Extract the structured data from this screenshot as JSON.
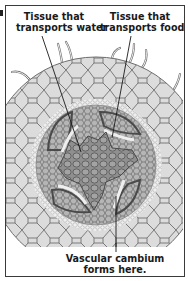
{
  "figure": {
    "type": "root cross-section illustration",
    "labels": {
      "water": {
        "line1": "Tissue that",
        "line2": "transports water"
      },
      "food": {
        "line1": "Tissue that",
        "line2": "transports food"
      },
      "cambium": {
        "line1": "Vascular cambium",
        "line2": "forms here."
      }
    },
    "colors": {
      "frame": "#3a3a3a",
      "parenchyma_fill": "#dcdcdc",
      "cell_wall": "#6e6e6e",
      "xylem_fill": "#8f8f8f",
      "phloem_fill": "#a9a9a9",
      "pericycle_fill": "#efefef",
      "leader_line": "#1a1a1a"
    }
  }
}
